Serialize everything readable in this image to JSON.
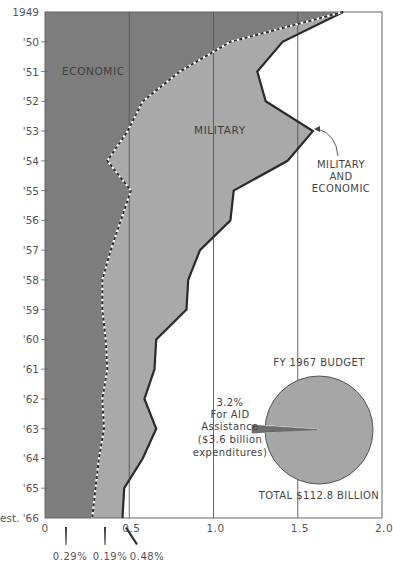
{
  "chart_data": {
    "type": "area",
    "orientation": "horizontal",
    "title": "",
    "xlabel": "",
    "ylabel": "",
    "xlim": [
      0,
      2.0
    ],
    "x_ticks": [
      "0",
      "0.5",
      "1.0",
      "1.5",
      "2.0"
    ],
    "y_categories": [
      "1949",
      "'50",
      "'51",
      "'52",
      "'53",
      "'54",
      "'55",
      "'56",
      "'57",
      "'58",
      "'59",
      "'60",
      "'61",
      "'62",
      "'63",
      "'64",
      "'65",
      "est. '66"
    ],
    "series": [
      {
        "name": "ECONOMIC",
        "style": "dashed boundary",
        "values": [
          1.77,
          1.1,
          0.8,
          0.58,
          0.49,
          0.37,
          0.51,
          0.45,
          0.39,
          0.34,
          0.34,
          0.36,
          0.37,
          0.34,
          0.35,
          0.32,
          0.3,
          0.28
        ]
      },
      {
        "name": "MILITARY AND ECONOMIC",
        "style": "solid boundary",
        "values": [
          1.77,
          1.41,
          1.26,
          1.31,
          1.59,
          1.44,
          1.12,
          1.1,
          0.92,
          0.85,
          0.84,
          0.66,
          0.65,
          0.59,
          0.66,
          0.58,
          0.47,
          0.46
        ]
      }
    ],
    "area_labels": [
      "ECONOMIC",
      "MILITARY"
    ],
    "annotations": {
      "total_line_label": [
        "MILITARY",
        "AND",
        "ECONOMIC"
      ],
      "bottom_markers": [
        {
          "label": "0.29%",
          "x": 0.29
        },
        {
          "label": "0.19%",
          "x": 0.19
        },
        {
          "label": "0.48%",
          "x": 0.48
        }
      ]
    },
    "gridlines": [
      0.5,
      1.0,
      1.5
    ],
    "inset_pie": {
      "type": "pie",
      "title": "FY 1967 BUDGET",
      "total_label": "TOTAL $112.8 BILLION",
      "slices": [
        {
          "label": "For AID Assistance",
          "value": 3.2,
          "unit": "%",
          "note": "($3.6 billion expenditures)"
        },
        {
          "label": "Other",
          "value": 96.8,
          "unit": "%"
        }
      ],
      "callout": [
        "3.2%",
        "For AID",
        "Assistance",
        "($3.6 billion",
        "expenditures)"
      ]
    }
  },
  "colors": {
    "economic": "#7d7d7d",
    "military": "#a9a9a9",
    "background": "#ffffff",
    "line": "#2a2a2a",
    "pie": "#a6a6a6",
    "pie_wedge": "#6e6e6e"
  },
  "labels": {
    "economic": "ECONOMIC",
    "military": "MILITARY",
    "mil_econ_1": "MILITARY",
    "mil_econ_2": "AND",
    "mil_econ_3": "ECONOMIC",
    "pie_title": "FY 1967 BUDGET",
    "pie_total": "TOTAL $112.8 BILLION",
    "pie_c1": "3.2%",
    "pie_c2": "For AID",
    "pie_c3": "Assistance",
    "pie_c4": "($3.6 billion",
    "pie_c5": "expenditures)",
    "pct1": "0.29%",
    "pct2": "0.19%",
    "pct3": "0.48%"
  }
}
